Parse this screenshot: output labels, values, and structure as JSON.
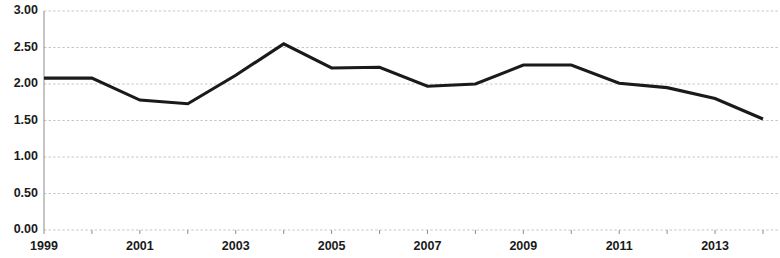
{
  "chart_data": {
    "type": "line",
    "title": "",
    "subtitle": "",
    "xlabel": "",
    "ylabel": "",
    "x": [
      1999,
      2000,
      2001,
      2002,
      2003,
      2004,
      2005,
      2006,
      2007,
      2008,
      2009,
      2010,
      2011,
      2012,
      2013,
      2014
    ],
    "values": [
      2.08,
      2.08,
      1.78,
      1.73,
      2.12,
      2.55,
      2.22,
      2.23,
      1.97,
      2.0,
      2.26,
      2.26,
      2.01,
      1.95,
      1.8,
      1.52
    ],
    "series": [
      {
        "name": "",
        "values": [
          2.08,
          2.08,
          1.78,
          1.73,
          2.12,
          2.55,
          2.22,
          2.23,
          1.97,
          2.0,
          2.26,
          2.26,
          2.01,
          1.95,
          1.8,
          1.52
        ],
        "color": "#1a1a1a"
      }
    ],
    "xlim": [
      1999,
      2014
    ],
    "ylim": [
      0.0,
      3.0
    ],
    "y_ticks": [
      0.0,
      0.5,
      1.0,
      1.5,
      2.0,
      2.5,
      3.0
    ],
    "y_tick_labels": [
      "0.00",
      "0.50",
      "1.00",
      "1.50",
      "2.00",
      "2.50",
      "3.00"
    ],
    "x_ticks": [
      1999,
      2000,
      2001,
      2002,
      2003,
      2004,
      2005,
      2006,
      2007,
      2008,
      2009,
      2010,
      2011,
      2012,
      2013,
      2014
    ],
    "x_tick_labels_shown": [
      "1999",
      "2001",
      "2003",
      "2005",
      "2007",
      "2009",
      "2011",
      "2013"
    ],
    "x_labels_interval": 2,
    "grid": true,
    "grid_axis": "y",
    "grid_style": "dashed",
    "legend": false,
    "legend_position": "none",
    "annotations": []
  }
}
